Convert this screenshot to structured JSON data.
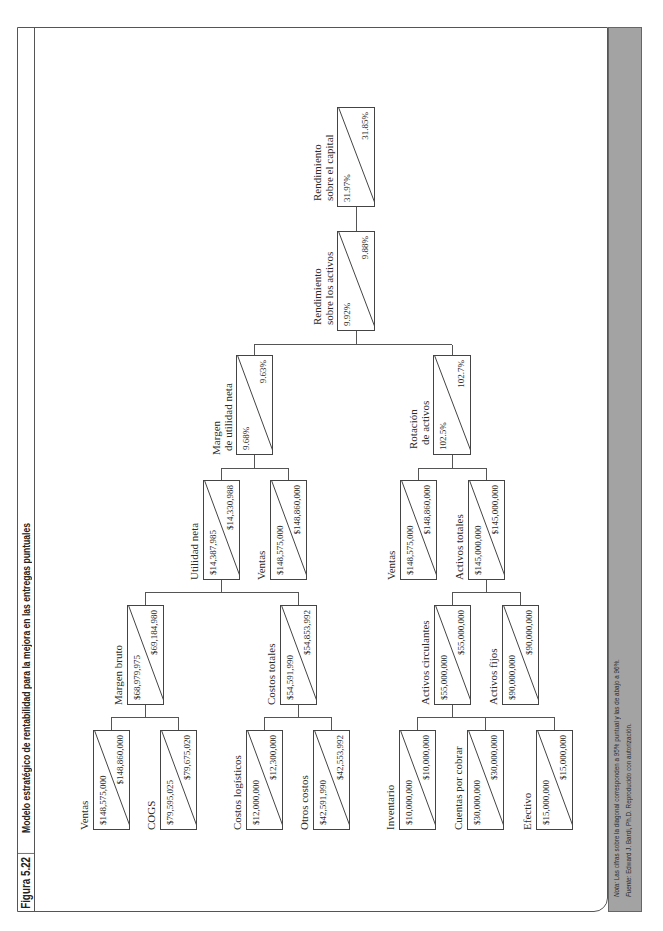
{
  "figure": {
    "number": "Figura 5.22",
    "title": "Modelo estratégico de rentabilidad para la mejora en las entregas puntuales"
  },
  "footer": {
    "note_label": "Nota:",
    "note_text": " Las cifras sobre la diagonal corresponden a 95% puntual y las de abajo a 96%.",
    "source_label": "Fuente:",
    "source_text": " Edward J. Bardi, Ph.D. Reproducido con autorización."
  },
  "colors": {
    "band": "#a3a3a3",
    "border": "#444444"
  },
  "tree": {
    "roe": {
      "label": [
        "Rendimiento",
        "sobre el capital"
      ],
      "v95": "31.97%",
      "v96": "31.85%"
    },
    "roa": {
      "label": [
        "Rendimiento",
        "sobre los activos"
      ],
      "v95": "9.92%",
      "v96": "9.88%"
    },
    "net_margin": {
      "label": [
        "Margen",
        "de utilidad neta"
      ],
      "v95": "9.68%",
      "v96": "9.63%"
    },
    "asset_turnover": {
      "label": [
        "Rotación",
        "de activos"
      ],
      "v95": "102.5%",
      "v96": "102.7%"
    },
    "net_income": {
      "label": [
        "Utilidad neta"
      ],
      "v95": "$14,387,985",
      "v96": "$14,330,988"
    },
    "sales_a": {
      "label": [
        "Ventas"
      ],
      "v95": "$148,575,000",
      "v96": "$148,860,000"
    },
    "sales_b": {
      "label": [
        "Ventas"
      ],
      "v95": "$148,575,000",
      "v96": "$148,860,000"
    },
    "total_assets": {
      "label": [
        "Activos totales"
      ],
      "v95": "$145,000,000",
      "v96": "$145,000,000"
    },
    "gross_margin": {
      "label": [
        "Margen bruto"
      ],
      "v95": "$68,979,975",
      "v96": "$69,184,980"
    },
    "total_costs": {
      "label": [
        "Costos totales"
      ],
      "v95": "$54,591,990",
      "v96": "$54,853,992"
    },
    "current_assets": {
      "label": [
        "Activos circulantes"
      ],
      "v95": "$55,000,000",
      "v96": "$55,000,000"
    },
    "fixed_assets": {
      "label": [
        "Activos fijos"
      ],
      "v95": "$90,000,000",
      "v96": "$90,000,000"
    },
    "sales_c": {
      "label": [
        "Ventas"
      ],
      "v95": "$148,575,000",
      "v96": "$148,860,000"
    },
    "cogs": {
      "label": [
        "COGS"
      ],
      "v95": "$79,595,025",
      "v96": "$79,675,020"
    },
    "logistics_costs": {
      "label": [
        "Costos logísticos"
      ],
      "v95": "$12,000,000",
      "v96": "$12,300,000"
    },
    "other_costs": {
      "label": [
        "Otros costos"
      ],
      "v95": "$42,591,990",
      "v96": "$42,553,992"
    },
    "inventory": {
      "label": [
        "Inventario"
      ],
      "v95": "$10,000,000",
      "v96": "$10,000,000"
    },
    "receivables": {
      "label": [
        "Cuentas por cobrar"
      ],
      "v95": "$30,000,000",
      "v96": "$30,000,000"
    },
    "cash": {
      "label": [
        "Efectivo"
      ],
      "v95": "$15,000,000",
      "v96": "$15,000,000"
    }
  }
}
